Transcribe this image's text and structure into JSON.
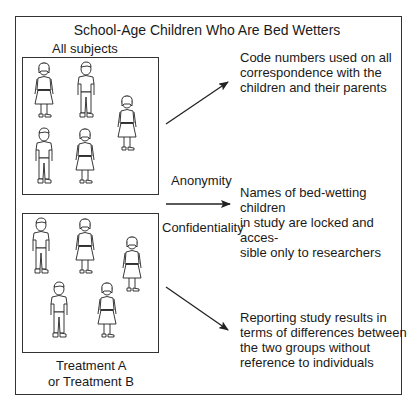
{
  "title": "School-Age Children Who Are Bed Wetters",
  "groups": {
    "top_label": "All subjects",
    "bottom_label_line1": "Treatment A",
    "bottom_label_line2": "or Treatment B"
  },
  "concepts": {
    "anonymity": "Anonymity",
    "confidentiality": "Confidentiality"
  },
  "notes": [
    {
      "lines": [
        "Code numbers used on all",
        "correspondence with the",
        "children and their parents"
      ]
    },
    {
      "lines": [
        "Names of bed-wetting children",
        "in study are locked and acces-",
        "sible only to researchers"
      ]
    },
    {
      "lines": [
        "Reporting study results in",
        "terms of differences between",
        "the two groups without",
        "reference to individuals"
      ]
    }
  ],
  "figures": {
    "top": [
      {
        "type": "girl",
        "x": 32,
        "y": 62
      },
      {
        "type": "boy",
        "x": 74,
        "y": 62
      },
      {
        "type": "girl",
        "x": 115,
        "y": 95
      },
      {
        "type": "boy",
        "x": 32,
        "y": 128
      },
      {
        "type": "girl",
        "x": 73,
        "y": 128
      }
    ],
    "bottom": [
      {
        "type": "boy",
        "x": 29,
        "y": 218
      },
      {
        "type": "girl",
        "x": 73,
        "y": 218
      },
      {
        "type": "girl",
        "x": 120,
        "y": 236
      },
      {
        "type": "boy",
        "x": 47,
        "y": 282
      },
      {
        "type": "girl",
        "x": 95,
        "y": 282
      }
    ]
  }
}
